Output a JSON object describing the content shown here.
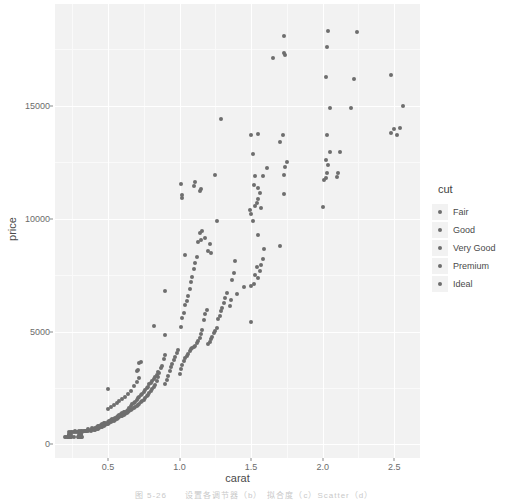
{
  "chart_data": {
    "type": "scatter",
    "title": "",
    "xlabel": "carat",
    "ylabel": "price",
    "xlim": [
      0.13,
      2.68
    ],
    "ylim": [
      -600,
      19500
    ],
    "grid": true,
    "legend_position": "right",
    "legend": {
      "title": "cut",
      "entries": [
        "Fair",
        "Good",
        "Very Good",
        "Premium",
        "Ideal"
      ]
    },
    "x_ticks": [
      0.5,
      1.0,
      1.5,
      2.0,
      2.5
    ],
    "x_tick_labels": [
      "0.5",
      "1.0",
      "1.5",
      "2.0",
      "2.5"
    ],
    "y_ticks": [
      0,
      5000,
      10000,
      15000
    ],
    "y_tick_labels": [
      "0",
      "5000",
      "10000",
      "15000"
    ],
    "x_minor_ticks": [
      0.25,
      0.75,
      1.25,
      1.75,
      2.25
    ],
    "y_minor_ticks": [
      2500,
      7500,
      12500,
      17500
    ],
    "point_color": "#6e6e6e",
    "panel_color": "#f2f2f2",
    "gridline_color": "#ffffff",
    "series": [
      {
        "name": "diamonds",
        "points": [
          [
            0.23,
            326
          ],
          [
            0.21,
            326
          ],
          [
            0.23,
            327
          ],
          [
            0.29,
            334
          ],
          [
            0.31,
            335
          ],
          [
            0.24,
            336
          ],
          [
            0.24,
            336
          ],
          [
            0.26,
            337
          ],
          [
            0.22,
            337
          ],
          [
            0.23,
            338
          ],
          [
            0.3,
            339
          ],
          [
            0.23,
            340
          ],
          [
            0.22,
            342
          ],
          [
            0.31,
            344
          ],
          [
            0.2,
            345
          ],
          [
            0.32,
            345
          ],
          [
            0.3,
            348
          ],
          [
            0.3,
            351
          ],
          [
            0.3,
            351
          ],
          [
            0.3,
            351
          ],
          [
            0.23,
            402
          ],
          [
            0.23,
            402
          ],
          [
            0.31,
            402
          ],
          [
            0.31,
            402
          ],
          [
            0.23,
            403
          ],
          [
            0.24,
            404
          ],
          [
            0.3,
            405
          ],
          [
            0.23,
            405
          ],
          [
            0.23,
            552
          ],
          [
            0.31,
            552
          ],
          [
            0.24,
            553
          ],
          [
            0.3,
            554
          ],
          [
            0.25,
            556
          ],
          [
            0.29,
            558
          ],
          [
            0.28,
            560
          ],
          [
            0.32,
            561
          ],
          [
            0.31,
            570
          ],
          [
            0.26,
            571
          ],
          [
            0.27,
            575
          ],
          [
            0.33,
            576
          ],
          [
            0.34,
            579
          ],
          [
            0.35,
            580
          ],
          [
            0.36,
            583
          ],
          [
            0.3,
            589
          ],
          [
            0.34,
            592
          ],
          [
            0.32,
            595
          ],
          [
            0.35,
            599
          ],
          [
            0.38,
            604
          ],
          [
            0.35,
            610
          ],
          [
            0.31,
            613
          ],
          [
            0.4,
            625
          ],
          [
            0.41,
            640
          ],
          [
            0.38,
            650
          ],
          [
            0.36,
            662
          ],
          [
            0.42,
            675
          ],
          [
            0.4,
            689
          ],
          [
            0.43,
            700
          ],
          [
            0.39,
            712
          ],
          [
            0.44,
            725
          ],
          [
            0.41,
            740
          ],
          [
            0.45,
            756
          ],
          [
            0.42,
            772
          ],
          [
            0.46,
            789
          ],
          [
            0.43,
            802
          ],
          [
            0.47,
            818
          ],
          [
            0.44,
            834
          ],
          [
            0.48,
            850
          ],
          [
            0.45,
            866
          ],
          [
            0.49,
            884
          ],
          [
            0.46,
            900
          ],
          [
            0.5,
            918
          ],
          [
            0.47,
            935
          ],
          [
            0.51,
            952
          ],
          [
            0.48,
            969
          ],
          [
            0.52,
            988
          ],
          [
            0.5,
            1005
          ],
          [
            0.53,
            1021
          ],
          [
            0.51,
            1038
          ],
          [
            0.54,
            1055
          ],
          [
            0.52,
            1075
          ],
          [
            0.55,
            1092
          ],
          [
            0.53,
            1110
          ],
          [
            0.56,
            1128
          ],
          [
            0.54,
            1146
          ],
          [
            0.57,
            1165
          ],
          [
            0.55,
            1183
          ],
          [
            0.58,
            1200
          ],
          [
            0.56,
            1219
          ],
          [
            0.59,
            1238
          ],
          [
            0.57,
            1256
          ],
          [
            0.6,
            1276
          ],
          [
            0.58,
            1295
          ],
          [
            0.61,
            1314
          ],
          [
            0.59,
            1334
          ],
          [
            0.62,
            1354
          ],
          [
            0.6,
            1375
          ],
          [
            0.63,
            1395
          ],
          [
            0.61,
            1415
          ],
          [
            0.64,
            1436
          ],
          [
            0.62,
            1456
          ],
          [
            0.65,
            1477
          ],
          [
            0.63,
            1498
          ],
          [
            0.66,
            1520
          ],
          [
            0.64,
            1541
          ],
          [
            0.67,
            1563
          ],
          [
            0.5,
            1580
          ],
          [
            0.68,
            1602
          ],
          [
            0.65,
            1625
          ],
          [
            0.52,
            1640
          ],
          [
            0.69,
            1660
          ],
          [
            0.7,
            1688
          ],
          [
            0.66,
            1705
          ],
          [
            0.54,
            1725
          ],
          [
            0.71,
            1750
          ],
          [
            0.67,
            1772
          ],
          [
            0.72,
            1796
          ],
          [
            0.56,
            1815
          ],
          [
            0.68,
            1840
          ],
          [
            0.73,
            1865
          ],
          [
            0.69,
            1888
          ],
          [
            0.58,
            1910
          ],
          [
            0.74,
            1935
          ],
          [
            0.7,
            1960
          ],
          [
            0.75,
            1988
          ],
          [
            0.6,
            2010
          ],
          [
            0.71,
            2035
          ],
          [
            0.76,
            2060
          ],
          [
            0.72,
            2090
          ],
          [
            0.62,
            2115
          ],
          [
            0.77,
            2140
          ],
          [
            0.73,
            2170
          ],
          [
            0.78,
            2200
          ],
          [
            0.64,
            2228
          ],
          [
            0.74,
            2255
          ],
          [
            0.79,
            2285
          ],
          [
            0.75,
            2315
          ],
          [
            0.8,
            2345
          ],
          [
            0.66,
            2375
          ],
          [
            0.76,
            2405
          ],
          [
            0.81,
            2435
          ],
          [
            0.5,
            2465
          ],
          [
            0.77,
            2498
          ],
          [
            0.82,
            2528
          ],
          [
            0.78,
            2560
          ],
          [
            0.68,
            2590
          ],
          [
            0.83,
            2620
          ],
          [
            0.79,
            2655
          ],
          [
            0.9,
            2690
          ],
          [
            0.8,
            2720
          ],
          [
            0.7,
            2755
          ],
          [
            0.84,
            2790
          ],
          [
            0.81,
            2825
          ],
          [
            0.91,
            2858
          ],
          [
            0.82,
            2895
          ],
          [
            0.72,
            2930
          ],
          [
            0.85,
            2965
          ],
          [
            0.83,
            3000
          ],
          [
            0.92,
            3040
          ],
          [
            0.84,
            3075
          ],
          [
            1.0,
            3110
          ],
          [
            0.86,
            3150
          ],
          [
            0.85,
            3190
          ],
          [
            0.93,
            3230
          ],
          [
            0.7,
            3265
          ],
          [
            0.71,
            3310
          ],
          [
            1.01,
            3350
          ],
          [
            0.87,
            3390
          ],
          [
            0.94,
            3435
          ],
          [
            0.88,
            3475
          ],
          [
            1.02,
            3520
          ],
          [
            0.95,
            3560
          ],
          [
            0.72,
            3605
          ],
          [
            0.73,
            3650
          ],
          [
            1.03,
            3695
          ],
          [
            0.96,
            3740
          ],
          [
            0.89,
            3785
          ],
          [
            1.04,
            3830
          ],
          [
            0.97,
            3880
          ],
          [
            1.05,
            3925
          ],
          [
            0.9,
            3975
          ],
          [
            1.06,
            4020
          ],
          [
            0.98,
            4070
          ],
          [
            1.07,
            4120
          ],
          [
            0.99,
            4170
          ],
          [
            1.08,
            4220
          ],
          [
            1.09,
            4275
          ],
          [
            1.1,
            4325
          ],
          [
            1.11,
            4380
          ],
          [
            1.2,
            4435
          ],
          [
            1.12,
            4490
          ],
          [
            1.21,
            4545
          ],
          [
            1.13,
            4600
          ],
          [
            1.22,
            4660
          ],
          [
            1.14,
            4715
          ],
          [
            1.23,
            4775
          ],
          [
            0.9,
            4830
          ],
          [
            1.15,
            4890
          ],
          [
            1.24,
            4950
          ],
          [
            1.25,
            5010
          ],
          [
            1.16,
            5070
          ],
          [
            1.26,
            5135
          ],
          [
            1.01,
            5195
          ],
          [
            0.82,
            5260
          ],
          [
            1.5,
            5420
          ],
          [
            1.17,
            5490
          ],
          [
            1.27,
            5555
          ],
          [
            1.02,
            5620
          ],
          [
            1.28,
            5690
          ],
          [
            1.18,
            5760
          ],
          [
            1.03,
            5825
          ],
          [
            1.29,
            5900
          ],
          [
            1.19,
            5970
          ],
          [
            1.3,
            6040
          ],
          [
            1.35,
            6115
          ],
          [
            1.04,
            6185
          ],
          [
            1.31,
            6260
          ],
          [
            1.05,
            6335
          ],
          [
            1.36,
            6410
          ],
          [
            1.32,
            6485
          ],
          [
            1.06,
            6560
          ],
          [
            1.4,
            6640
          ],
          [
            1.33,
            6715
          ],
          [
            0.9,
            6790
          ],
          [
            1.07,
            6870
          ],
          [
            1.45,
            6950
          ],
          [
            1.5,
            7030
          ],
          [
            1.52,
            7110
          ],
          [
            1.08,
            7190
          ],
          [
            1.37,
            7270
          ],
          [
            1.55,
            7350
          ],
          [
            1.09,
            7435
          ],
          [
            1.53,
            7520
          ],
          [
            1.38,
            7600
          ],
          [
            1.56,
            7690
          ],
          [
            1.1,
            7775
          ],
          [
            1.54,
            7860
          ],
          [
            1.57,
            7945
          ],
          [
            1.11,
            8035
          ],
          [
            1.39,
            8125
          ],
          [
            1.58,
            8215
          ],
          [
            1.12,
            8305
          ],
          [
            1.04,
            8400
          ],
          [
            1.22,
            8490
          ],
          [
            1.2,
            8580
          ],
          [
            1.59,
            8675
          ],
          [
            1.7,
            8770
          ],
          [
            1.21,
            8865
          ],
          [
            1.13,
            8960
          ],
          [
            1.15,
            9060
          ],
          [
            1.18,
            9155
          ],
          [
            1.55,
            9255
          ],
          [
            1.14,
            9350
          ],
          [
            1.16,
            9450
          ],
          [
            1.26,
            9880
          ],
          [
            1.51,
            9890
          ],
          [
            1.5,
            10200
          ],
          [
            1.49,
            10400
          ],
          [
            1.53,
            10550
          ],
          [
            1.54,
            10700
          ],
          [
            1.02,
            10900
          ],
          [
            1.02,
            11050
          ],
          [
            1.55,
            10880
          ],
          [
            1.57,
            10450
          ],
          [
            2.0,
            10500
          ],
          [
            1.73,
            11100
          ],
          [
            1.14,
            11200
          ],
          [
            1.56,
            11150
          ],
          [
            1.15,
            11300
          ],
          [
            1.1,
            11450
          ],
          [
            1.55,
            11370
          ],
          [
            1.52,
            11500
          ],
          [
            1.01,
            11550
          ],
          [
            2.01,
            11700
          ],
          [
            2.02,
            11800
          ],
          [
            2.1,
            11850
          ],
          [
            1.25,
            11950
          ],
          [
            1.53,
            11900
          ],
          [
            1.58,
            11900
          ],
          [
            1.73,
            11950
          ],
          [
            1.11,
            11600
          ],
          [
            2.03,
            12000
          ],
          [
            2.11,
            12000
          ],
          [
            2.04,
            12350
          ],
          [
            1.74,
            12300
          ],
          [
            1.61,
            12250
          ],
          [
            1.75,
            12500
          ],
          [
            2.02,
            12600
          ],
          [
            1.51,
            12850
          ],
          [
            2.05,
            12950
          ],
          [
            2.12,
            12950
          ],
          [
            1.7,
            13400
          ],
          [
            1.5,
            13700
          ],
          [
            1.55,
            13750
          ],
          [
            2.03,
            13700
          ],
          [
            1.72,
            13700
          ],
          [
            2.48,
            13780
          ],
          [
            2.52,
            13700
          ],
          [
            2.5,
            13950
          ],
          [
            2.54,
            14000
          ],
          [
            1.29,
            14400
          ],
          [
            2.05,
            14900
          ],
          [
            2.2,
            14900
          ],
          [
            2.56,
            15000
          ],
          [
            2.22,
            16200
          ],
          [
            2.02,
            16250
          ],
          [
            2.48,
            16350
          ],
          [
            1.65,
            17100
          ],
          [
            1.73,
            17350
          ],
          [
            1.74,
            17250
          ],
          [
            2.03,
            17600
          ],
          [
            1.73,
            18100
          ],
          [
            2.04,
            18300
          ],
          [
            2.24,
            18250
          ]
        ]
      }
    ]
  },
  "caption": "图 5-26　　设置各调节器（b）　拟合度（c）Scatter（d）"
}
